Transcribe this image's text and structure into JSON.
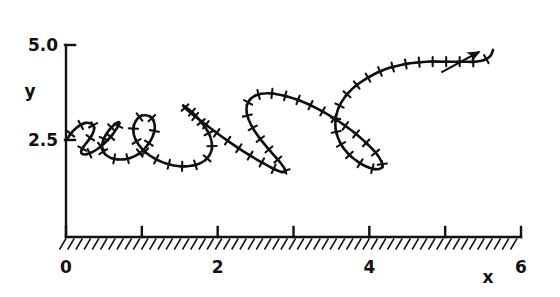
{
  "chart_data": {
    "type": "line",
    "title": "",
    "xlabel": "x",
    "ylabel": "y",
    "xlim": [
      0,
      6
    ],
    "ylim": [
      0.9,
      5.45
    ],
    "grid": false,
    "legend": null,
    "xticks": [
      0,
      1,
      2,
      3,
      4,
      5,
      6
    ],
    "xtick_labels": [
      "0",
      "",
      "2",
      "",
      "4",
      "",
      "6"
    ],
    "yticks": [
      2.5,
      5.0
    ],
    "ytick_labels": [
      "2.5",
      "5.0"
    ],
    "annotations": [
      {
        "name": "direction-arrow",
        "text": "",
        "x1": 4.95,
        "y1": 4.28,
        "x2": 5.45,
        "y2": 4.82
      }
    ],
    "ground": {
      "name": "hatched-ground",
      "y": 0.95,
      "x_from": 0,
      "x_to": 6,
      "hatch_angle_deg": 55
    },
    "series": [
      {
        "name": "prolate-cycloid-trajectory",
        "marker": "plus",
        "color": "#111111",
        "linewidth": 2.6,
        "description": "Looping cycloid-like path with loop size and height increasing left to right",
        "x": [
          0.02,
          0.06,
          0.12,
          0.19,
          0.26,
          0.32,
          0.36,
          0.37,
          0.35,
          0.31,
          0.26,
          0.22,
          0.2,
          0.21,
          0.25,
          0.31,
          0.39,
          0.47,
          0.55,
          0.62,
          0.67,
          0.7,
          0.7,
          0.67,
          0.62,
          0.56,
          0.51,
          0.48,
          0.48,
          0.52,
          0.59,
          0.68,
          0.79,
          0.9,
          1.0,
          1.08,
          1.14,
          1.17,
          1.16,
          1.12,
          1.05,
          0.98,
          0.92,
          0.89,
          0.9,
          0.96,
          1.06,
          1.19,
          1.34,
          1.5,
          1.65,
          1.78,
          1.87,
          1.92,
          1.92,
          1.88,
          1.8,
          1.71,
          1.62,
          1.56,
          1.55,
          1.59,
          1.69,
          1.84,
          2.02,
          2.22,
          2.42,
          2.6,
          2.74,
          2.84,
          2.89,
          2.88,
          2.82,
          2.72,
          2.6,
          2.49,
          2.41,
          2.38,
          2.41,
          2.5,
          2.65,
          2.85,
          3.08,
          3.32,
          3.56,
          3.78,
          3.96,
          4.09,
          4.16,
          4.17,
          4.11,
          4.0,
          3.87,
          3.73,
          3.62,
          3.56,
          3.56,
          3.63,
          3.77,
          3.97,
          4.21,
          4.48,
          4.75,
          5.0,
          5.22,
          5.4,
          5.52,
          5.6,
          5.63
        ],
        "y": [
          2.53,
          2.66,
          2.79,
          2.89,
          2.95,
          2.94,
          2.88,
          2.78,
          2.66,
          2.53,
          2.4,
          2.29,
          2.2,
          2.14,
          2.12,
          2.15,
          2.23,
          2.35,
          2.5,
          2.66,
          2.81,
          2.92,
          2.97,
          2.95,
          2.87,
          2.74,
          2.58,
          2.41,
          2.25,
          2.12,
          2.03,
          1.99,
          2.0,
          2.07,
          2.2,
          2.38,
          2.58,
          2.79,
          2.97,
          3.1,
          3.15,
          3.12,
          3.0,
          2.82,
          2.6,
          2.37,
          2.16,
          1.99,
          1.87,
          1.81,
          1.82,
          1.9,
          2.04,
          2.23,
          2.45,
          2.69,
          2.93,
          3.14,
          3.3,
          3.39,
          3.4,
          3.31,
          3.14,
          2.91,
          2.64,
          2.36,
          2.1,
          1.89,
          1.74,
          1.66,
          1.66,
          1.75,
          1.92,
          2.15,
          2.43,
          2.73,
          3.03,
          3.3,
          3.52,
          3.67,
          3.73,
          3.68,
          3.54,
          3.32,
          3.04,
          2.73,
          2.42,
          2.15,
          1.93,
          1.79,
          1.73,
          1.77,
          1.9,
          2.12,
          2.41,
          2.75,
          3.12,
          3.49,
          3.84,
          4.13,
          4.36,
          4.5,
          4.56,
          4.56,
          4.56,
          4.56,
          4.61,
          4.72,
          4.87
        ]
      }
    ]
  }
}
